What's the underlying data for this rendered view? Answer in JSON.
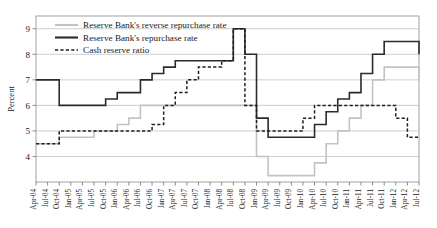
{
  "chart_data": {
    "type": "line",
    "title": "",
    "subtitle": "",
    "xlabel": "",
    "ylabel": "Percent",
    "ylim": [
      3,
      9.5
    ],
    "yticks": [
      4,
      5,
      6,
      7,
      8,
      9
    ],
    "ytick_labels": [
      "4",
      "5",
      "6",
      "7",
      "8",
      "9"
    ],
    "grid": true,
    "legend_position": "top-left",
    "x": [
      "Apr-04",
      "Jul-04",
      "Oct-04",
      "Jan-05",
      "Apr-05",
      "Jul-05",
      "Oct-05",
      "Jan-06",
      "Apr-06",
      "Jul-06",
      "Oct-06",
      "Jan-07",
      "Apr-07",
      "Jul-07",
      "Oct-07",
      "Jan-08",
      "Apr-08",
      "Jul-08",
      "Oct-08",
      "Jan-09",
      "Apr-09",
      "Jul-09",
      "Oct-09",
      "Jan-10",
      "Apr-10",
      "Jul-10",
      "Oct-10",
      "Jan-11",
      "Apr-11",
      "Jul-11",
      "Oct-11",
      "Jan-12",
      "Apr-12",
      "Jul-12"
    ],
    "series": [
      {
        "name": "Reserve Bank's reverse repurchase rate",
        "color": "#c3c3c3",
        "style": "solid",
        "values": [
          4.5,
          4.5,
          4.75,
          4.75,
          4.75,
          5.0,
          5.0,
          5.25,
          5.5,
          6.0,
          6.0,
          6.0,
          6.0,
          6.0,
          6.0,
          6.0,
          6.0,
          6.0,
          6.0,
          4.0,
          3.25,
          3.25,
          3.25,
          3.25,
          3.75,
          4.5,
          5.0,
          5.5,
          6.0,
          7.0,
          7.5,
          7.5,
          7.5,
          7.0
        ]
      },
      {
        "name": "Reserve Bank's repurchase rate",
        "color": "#2b2b2b",
        "style": "solid",
        "values": [
          7.0,
          7.0,
          6.0,
          6.0,
          6.0,
          6.0,
          6.25,
          6.5,
          6.5,
          7.0,
          7.25,
          7.5,
          7.75,
          7.75,
          7.75,
          7.75,
          7.75,
          9.0,
          8.0,
          5.5,
          4.75,
          4.75,
          4.75,
          4.75,
          5.25,
          5.75,
          6.25,
          6.5,
          7.25,
          8.0,
          8.5,
          8.5,
          8.5,
          8.0
        ]
      },
      {
        "name": "Cash reserve ratio",
        "color": "#1f1f1f",
        "style": "dashed",
        "values": [
          4.5,
          4.5,
          5.0,
          5.0,
          5.0,
          5.0,
          5.0,
          5.0,
          5.0,
          5.0,
          5.25,
          6.0,
          6.5,
          7.0,
          7.5,
          7.5,
          7.75,
          9.0,
          6.0,
          5.0,
          5.0,
          5.0,
          5.0,
          5.5,
          6.0,
          6.0,
          6.0,
          6.0,
          6.0,
          6.0,
          6.0,
          5.5,
          4.75,
          4.75
        ]
      }
    ],
    "legend": [
      {
        "label": "Reserve Bank's reverse repurchase rate",
        "color": "#c3c3c3",
        "style": "solid"
      },
      {
        "label": "Reserve Bank's repurchase rate",
        "color": "#2b2b2b",
        "style": "solid"
      },
      {
        "label": "Cash reserve ratio",
        "color": "#1f1f1f",
        "style": "dashed"
      }
    ]
  }
}
